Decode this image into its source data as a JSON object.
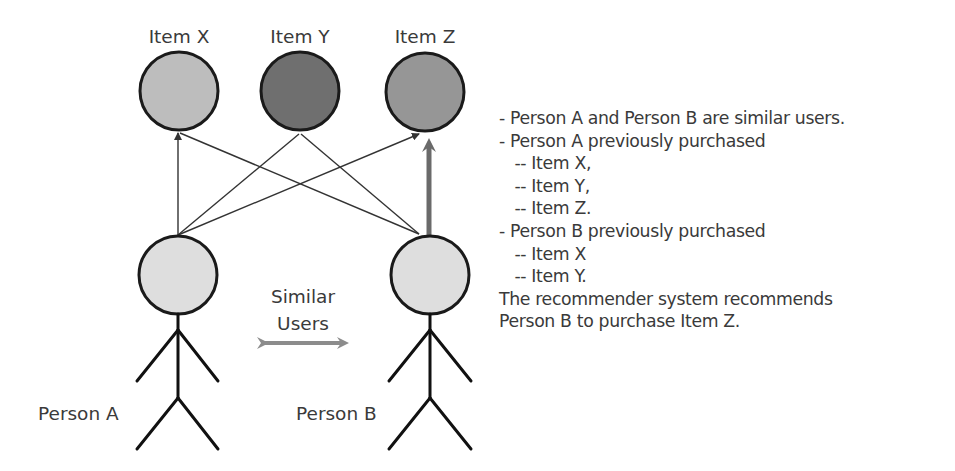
{
  "diagram": {
    "items": [
      {
        "label": "Item X",
        "fill": "#bdbdbd"
      },
      {
        "label": "Item Y",
        "fill": "#6f6f6f"
      },
      {
        "label": "Item Z",
        "fill": "#969696"
      }
    ],
    "persons": [
      {
        "label": "Person A",
        "fill": "#dedede"
      },
      {
        "label": "Person B",
        "fill": "#dedede"
      }
    ],
    "similarity": {
      "line1": "Similar",
      "line2": "Users",
      "arrow_color": "#8c8c8c"
    },
    "edges": [
      {
        "from": "Person A",
        "to": "Item X",
        "type": "purchased"
      },
      {
        "from": "Person A",
        "to": "Item Y",
        "type": "purchased"
      },
      {
        "from": "Person A",
        "to": "Item Z",
        "type": "purchased"
      },
      {
        "from": "Person B",
        "to": "Item X",
        "type": "purchased"
      },
      {
        "from": "Person B",
        "to": "Item Y",
        "type": "purchased"
      },
      {
        "from": "Person B",
        "to": "Item Z",
        "type": "recommended"
      }
    ],
    "recommend_arrow_color": "#6a6a6a"
  },
  "explanation": {
    "lines": [
      "- Person A and Person B are similar users.",
      "- Person A previously purchased",
      "   -- Item X,",
      "   -- Item Y,",
      "   -- Item Z.",
      "- Person B previously purchased",
      "   -- Item X",
      "   -- Item Y.",
      "The recommender system recommends",
      "Person B to purchase Item Z."
    ]
  }
}
